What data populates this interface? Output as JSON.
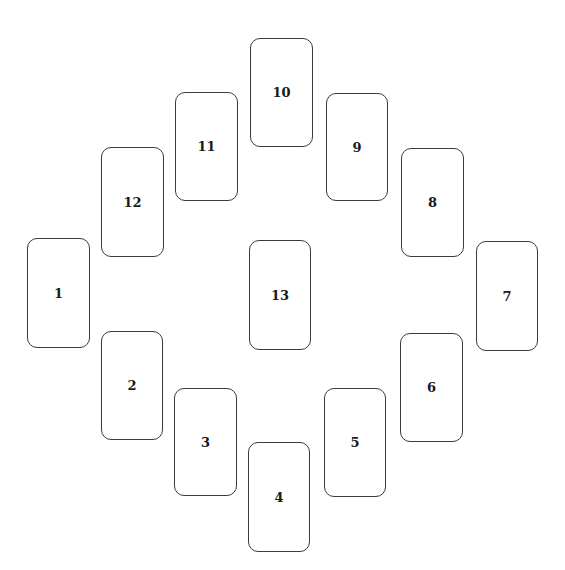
{
  "diagram": {
    "type": "card-spread",
    "cards": [
      {
        "label": "1",
        "x": 27,
        "y": 238,
        "w": 63,
        "h": 110
      },
      {
        "label": "2",
        "x": 101,
        "y": 331,
        "w": 62,
        "h": 109
      },
      {
        "label": "3",
        "x": 174,
        "y": 388,
        "w": 63,
        "h": 108
      },
      {
        "label": "4",
        "x": 248,
        "y": 442,
        "w": 62,
        "h": 110
      },
      {
        "label": "5",
        "x": 324,
        "y": 388,
        "w": 62,
        "h": 109
      },
      {
        "label": "6",
        "x": 400,
        "y": 333,
        "w": 63,
        "h": 109
      },
      {
        "label": "7",
        "x": 476,
        "y": 241,
        "w": 62,
        "h": 110
      },
      {
        "label": "8",
        "x": 401,
        "y": 148,
        "w": 63,
        "h": 109
      },
      {
        "label": "9",
        "x": 326,
        "y": 93,
        "w": 62,
        "h": 108
      },
      {
        "label": "10",
        "x": 250,
        "y": 38,
        "w": 63,
        "h": 109
      },
      {
        "label": "11",
        "x": 175,
        "y": 92,
        "w": 63,
        "h": 109
      },
      {
        "label": "12",
        "x": 101,
        "y": 147,
        "w": 63,
        "h": 110
      },
      {
        "label": "13",
        "x": 249,
        "y": 240,
        "w": 62,
        "h": 110
      }
    ]
  }
}
